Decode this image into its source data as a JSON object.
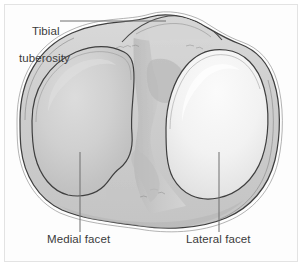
{
  "figure": {
    "kind": "anatomical-illustration",
    "background_color": "#fdfdfd",
    "frame_color": "#e3e3e3",
    "outline_color": "#3f3f3f",
    "bone_fill_color": "#cfcfcf",
    "medial_facet_color": "#c9c9c9",
    "lateral_facet_color": "#f1f1f1",
    "leader_line_color": "#6e6e6e",
    "label_text_color": "#3b3b3b"
  },
  "labels": {
    "tibial_tuberosity": {
      "line1": "Tibial",
      "line2": "tuberosity"
    },
    "medial_facet": "Medial facet",
    "lateral_facet": "Lateral facet"
  },
  "leaders": [
    {
      "name": "tibial-tuberosity-leader",
      "orientation": "horizontal",
      "from": [
        60,
        21
      ],
      "to": [
        166,
        21
      ]
    },
    {
      "name": "medial-facet-leader",
      "orientation": "vertical",
      "from": [
        80,
        152
      ],
      "to": [
        80,
        232
      ]
    },
    {
      "name": "lateral-facet-leader",
      "orientation": "vertical",
      "from": [
        219,
        152
      ],
      "to": [
        219,
        232
      ]
    }
  ]
}
